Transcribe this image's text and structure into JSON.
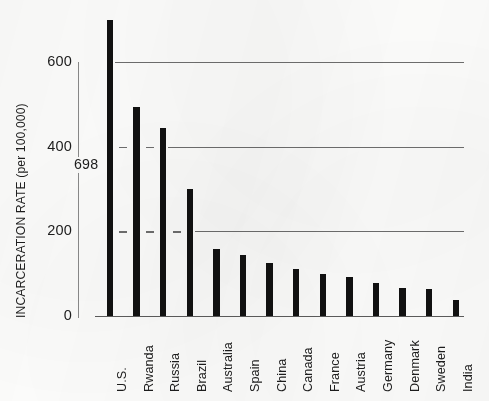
{
  "chart_data": {
    "type": "bar",
    "title": "",
    "subtitle": "",
    "xlabel": "",
    "ylabel": "INCARCERATION RATE (per 100,000)",
    "categories": [
      "U.S.",
      "Rwanda",
      "Russia",
      "Brazil",
      "Australia",
      "Spain",
      "China",
      "Canada",
      "France",
      "Austria",
      "Germany",
      "Denmark",
      "Sweden",
      "India"
    ],
    "values": [
      698,
      494,
      444,
      301,
      158,
      144,
      125,
      111,
      99,
      92,
      78,
      67,
      64,
      38
    ],
    "ylim": [
      0,
      740
    ],
    "yticks": [
      0,
      200,
      400,
      600
    ],
    "ytick_labels": [
      "0",
      "200",
      "400",
      "600"
    ],
    "grid": "horizontal",
    "gridlines_at": [
      200,
      400,
      600
    ],
    "legend": "none",
    "annotations": [
      {
        "label": "698",
        "category": "U.S.",
        "value": 698
      }
    ],
    "bar_color": "#111111",
    "gridline_color": "#6e6e6e",
    "axis_color": "#5c5c5c",
    "background_color": "#fdfdfc",
    "text_color": "#1d1d1d"
  }
}
